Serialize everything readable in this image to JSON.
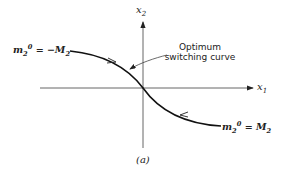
{
  "axes": {
    "x_label_base": "x",
    "x_label_sub": "1",
    "y_label_base": "x",
    "y_label_sub": "2"
  },
  "curve_labels": {
    "left": {
      "m": "m",
      "sub": "2",
      "sup": "0",
      "rhs": "= −M",
      "rhs_sub": "2"
    },
    "right": {
      "m": "m",
      "sub": "2",
      "sup": "0",
      "rhs": "= M",
      "rhs_sub": "2"
    }
  },
  "annotation": {
    "line1": "Optimum",
    "line2": "switching curve"
  },
  "caption": "(a)",
  "colors": {
    "stroke": "#222222",
    "background": "#ffffff"
  }
}
